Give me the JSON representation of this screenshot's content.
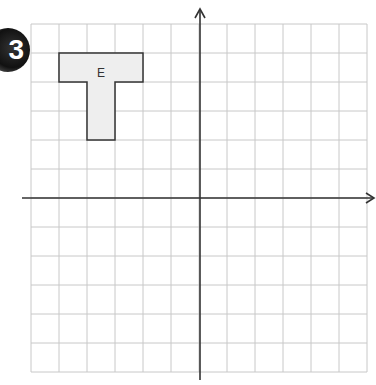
{
  "question_number": "3",
  "grid": {
    "cols": 12,
    "rows": 12,
    "left": 31,
    "top": 24,
    "cell_w": 28,
    "cell_h": 29
  },
  "axes": {
    "origin_col": 6,
    "origin_row": 6
  },
  "shape": {
    "label": "E",
    "description": "T-shaped polygon",
    "vertices_grid": [
      [
        -5,
        5
      ],
      [
        -2,
        5
      ],
      [
        -2,
        4
      ],
      [
        -3,
        4
      ],
      [
        -3,
        2
      ],
      [
        -4,
        2
      ],
      [
        -4,
        4
      ],
      [
        -5,
        4
      ]
    ],
    "fill": "#eeeeee",
    "stroke": "#333333"
  }
}
